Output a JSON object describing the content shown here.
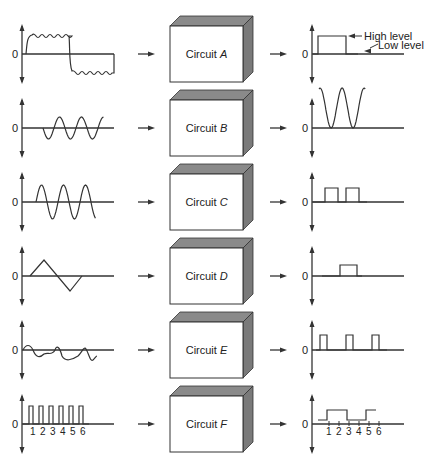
{
  "figure": {
    "rows": [
      {
        "id": "A",
        "circuit_label": "Circuit ",
        "circuit_letter": "A",
        "zero_label": "0",
        "input": "distorted-square",
        "output": "single-pulse",
        "annotations": [
          "High level",
          "Low level"
        ]
      },
      {
        "id": "B",
        "circuit_label": "Circuit ",
        "circuit_letter": "B",
        "zero_label": "0",
        "input": "sine-burst-small",
        "output": "large-sine-offset"
      },
      {
        "id": "C",
        "circuit_label": "Circuit ",
        "circuit_letter": "C",
        "zero_label": "0",
        "input": "sine-burst-large",
        "output": "two-pulses"
      },
      {
        "id": "D",
        "circuit_label": "Circuit ",
        "circuit_letter": "D",
        "zero_label": "0",
        "input": "triangle",
        "output": "delayed-pulse"
      },
      {
        "id": "E",
        "circuit_label": "Circuit ",
        "circuit_letter": "E",
        "zero_label": "0",
        "input": "noisy-wave",
        "output": "three-pulses"
      },
      {
        "id": "F",
        "circuit_label": "Circuit ",
        "circuit_letter": "F",
        "zero_label": "0",
        "input": "pulse-train",
        "output": "divided-pulses",
        "tick_labels": [
          "1",
          "2",
          "3",
          "4",
          "5",
          "6"
        ]
      }
    ],
    "annotations": {
      "high_level": "High level",
      "low_level": "Low level"
    },
    "colors": {
      "line": "#333333",
      "box_top": "#8a8a8a",
      "box_side": "#7a7a7a",
      "box_front": "#ffffff"
    }
  }
}
